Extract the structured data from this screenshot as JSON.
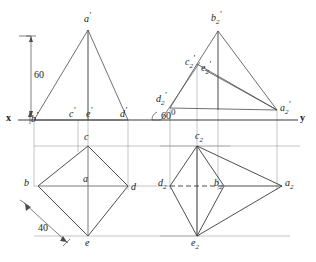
{
  "drawing": {
    "title": "Orthographic projection: elevation and plan of a pyramid",
    "axes": {
      "x_label": "x",
      "y_label": "y",
      "xy_line_y": 120
    },
    "dimensions": [
      {
        "name": "height",
        "value": "60",
        "unit": ""
      },
      {
        "name": "base-edge",
        "value": "40",
        "unit": ""
      }
    ],
    "angle": {
      "value": "60",
      "degree_symbol": "0"
    },
    "colors": {
      "line": "#4a4a4a",
      "heavy_line": "#2b2b2b",
      "text": "#1a1a1a",
      "background": "#ffffff"
    },
    "labels": {
      "elevation_left": [
        {
          "id": "a-prime",
          "base": "a",
          "prime": "'",
          "x": 84,
          "y": 11
        },
        {
          "id": "b-prime",
          "base": "b",
          "prime": "'",
          "x": 31,
          "y": 113
        },
        {
          "id": "c-prime",
          "base": "c",
          "prime": "'",
          "x": 68,
          "y": 107
        },
        {
          "id": "e-prime",
          "base": "e",
          "prime": "'",
          "x": 85,
          "y": 107
        },
        {
          "id": "d-prime",
          "base": "d",
          "prime": "'",
          "x": 119,
          "y": 107
        }
      ],
      "elevation_right": [
        {
          "id": "b2-prime",
          "base": "b",
          "subscript": "2",
          "prime": "'",
          "x": 212,
          "y": 11
        },
        {
          "id": "c2-prime",
          "base": "c",
          "subscript": "2",
          "prime": "'",
          "x": 186,
          "y": 55
        },
        {
          "id": "e2-prime",
          "base": "e",
          "subscript": "2",
          "prime": "'",
          "x": 202,
          "y": 61
        },
        {
          "id": "d2-prime",
          "base": "d",
          "subscript": "2",
          "prime": "'",
          "x": 159,
          "y": 92
        },
        {
          "id": "a2-prime",
          "base": "a",
          "subscript": "2",
          "prime": "'",
          "x": 281,
          "y": 102
        }
      ],
      "plan_left": [
        {
          "id": "c",
          "base": "c",
          "x": 84,
          "y": 133
        },
        {
          "id": "b",
          "base": "b",
          "x": 25,
          "y": 178
        },
        {
          "id": "a",
          "base": "a",
          "x": 84,
          "y": 176
        },
        {
          "id": "d",
          "base": "d",
          "x": 131,
          "y": 180
        },
        {
          "id": "e",
          "base": "e",
          "x": 85,
          "y": 238
        }
      ],
      "plan_right": [
        {
          "id": "c2",
          "base": "c",
          "subscript": "2",
          "x": 196,
          "y": 132
        },
        {
          "id": "d2",
          "base": "d",
          "subscript": "2",
          "x": 160,
          "y": 178
        },
        {
          "id": "b2",
          "base": "b",
          "subscript": "2",
          "x": 216,
          "y": 178
        },
        {
          "id": "a2",
          "base": "a",
          "subscript": "2",
          "x": 286,
          "y": 178
        },
        {
          "id": "e2",
          "base": "e",
          "subscript": "2",
          "x": 193,
          "y": 238
        }
      ]
    },
    "geometry": {
      "elevation_left": {
        "apex": [
          88,
          30
        ],
        "b_prime": [
          34,
          120
        ],
        "c_prime": [
          78,
          120
        ],
        "e_prime": [
          88,
          120
        ],
        "d_prime": [
          128,
          120
        ]
      },
      "plan_left": {
        "c": [
          88,
          146
        ],
        "b": [
          38,
          186
        ],
        "d": [
          128,
          186
        ],
        "e": [
          88,
          236
        ],
        "a": [
          88,
          186
        ]
      },
      "elevation_right": {
        "b2_prime": [
          218,
          31
        ],
        "c2_prime": [
          197,
          64
        ],
        "e2_prime": [
          205,
          70
        ],
        "d2_prime": [
          170,
          108
        ],
        "a2_prime": [
          277,
          110
        ],
        "angle_vertex": [
          161,
          120
        ]
      },
      "plan_right": {
        "c2": [
          197,
          146
        ],
        "d2": [
          170,
          186
        ],
        "b2": [
          224,
          186
        ],
        "a2": [
          282,
          186
        ],
        "e2": [
          197,
          236
        ]
      }
    }
  }
}
